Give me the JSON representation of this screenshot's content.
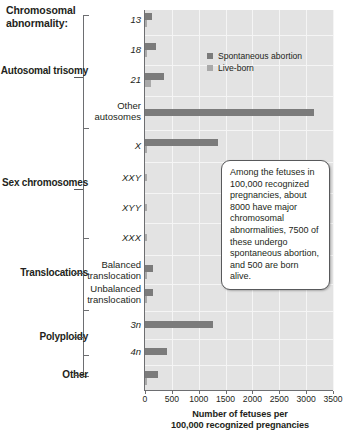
{
  "header": {
    "title": "Chromosomal abnormality:"
  },
  "legend": {
    "items": [
      {
        "label": "Spontaneous abortion",
        "color": "#7b7b7b",
        "key": "spontaneous"
      },
      {
        "label": "Live-born",
        "color": "#a9a9a9",
        "key": "liveborn"
      }
    ]
  },
  "callout": {
    "text": "Among the fetuses in 100,000 recognized pregnancies, about 8000 have major chromosomal abnormalities, 7500 of these undergo spontaneous abortion, and 500 are born alive."
  },
  "groups": [
    {
      "label": "Autosomal trisomy",
      "name": "autosomal-trisomy"
    },
    {
      "label": "Sex chromosomes",
      "name": "sex-chromosomes"
    },
    {
      "label": "Translocations",
      "name": "translocations"
    },
    {
      "label": "Polyploidy",
      "name": "polyploidy"
    },
    {
      "label": "Other",
      "name": "other"
    }
  ],
  "chart_data": {
    "type": "bar",
    "orientation": "horizontal",
    "title": "",
    "xlabel": "Number of fetuses per 100,000 recognized pregnancies",
    "ylabel": "Chromosomal abnormality:",
    "xlim": [
      0,
      3500
    ],
    "xticks": [
      0,
      500,
      1000,
      1500,
      2000,
      2500,
      3000,
      3500
    ],
    "xtick_labels": [
      "0",
      "500",
      "1000",
      "1500",
      "2000",
      "2500",
      "3000",
      "3500"
    ],
    "grid": true,
    "legend_position": "upper-right-inside",
    "categories": [
      "13",
      "18",
      "21",
      "Other autosomes",
      "X",
      "XXY",
      "XYY",
      "XXX",
      "Balanced translocation",
      "Unbalanced translocation",
      "3n",
      "4n",
      "Other"
    ],
    "category_styles": [
      "italic",
      "italic",
      "italic",
      "plain",
      "italic",
      "italic",
      "italic",
      "italic",
      "plain",
      "plain",
      "italic",
      "italic",
      "plain"
    ],
    "series": [
      {
        "name": "Spontaneous abortion",
        "color": "#7b7b7b",
        "values": [
          128,
          205,
          350,
          3150,
          1350,
          0,
          0,
          0,
          140,
          140,
          1275,
          415,
          250
        ]
      },
      {
        "name": "Live-born",
        "color": "#a9a9a9",
        "values": [
          8,
          14,
          120,
          0,
          5,
          28,
          28,
          28,
          46,
          28,
          0,
          0,
          30
        ]
      }
    ]
  }
}
